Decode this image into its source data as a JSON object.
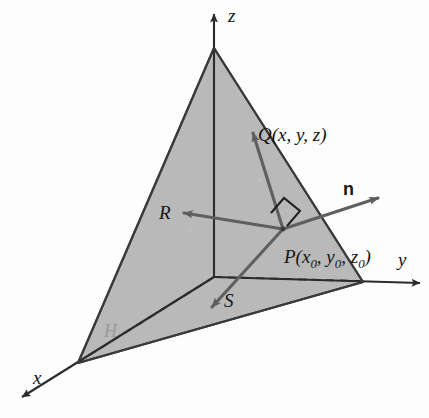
{
  "figure": {
    "background_color": "#fdfdfd",
    "plane_fill_color": "#b9b9b9",
    "plane_edge_color": "#3a3a3a",
    "axis_color": "#2b2b2b",
    "vector_color": "#5a5a5a",
    "dashed_color": "#333333",
    "faint_label_color": "#9a9a9a"
  },
  "axes": [
    {
      "id": "x",
      "label": "x",
      "label_x": 33,
      "label_y": 368,
      "direction": "down-left"
    },
    {
      "id": "y",
      "label": "y",
      "label_x": 398,
      "label_y": 250,
      "direction": "right"
    },
    {
      "id": "z",
      "label": "z",
      "label_x": 228,
      "label_y": 6,
      "direction": "up"
    }
  ],
  "points": [
    {
      "id": "P",
      "name": "P",
      "coords_text": "P(x0, y0, z0)",
      "base": "P(x",
      "sub1": "0",
      "mid1": ", y",
      "sub2": "0",
      "mid2": ", z",
      "sub3": "0",
      "tail": ")",
      "label_x": 284,
      "label_y": 247,
      "point_x": 283,
      "point_y": 229
    },
    {
      "id": "Q",
      "name": "Q",
      "coords_text": "Q(x, y, z)",
      "label_x": 258,
      "label_y": 125,
      "point_x": 252,
      "point_y": 131
    }
  ],
  "vectors": [
    {
      "id": "n",
      "label": "n",
      "label_x": 343,
      "label_y": 180,
      "from_x": 283,
      "from_y": 229,
      "to_x": 381,
      "to_y": 197,
      "bold": true
    },
    {
      "id": "PQ",
      "label": "",
      "label_x": 0,
      "label_y": 0,
      "from_x": 283,
      "from_y": 229,
      "to_x": 251,
      "to_y": 129,
      "bold": false
    },
    {
      "id": "R",
      "label": "R",
      "label_x": 159,
      "label_y": 203,
      "from_x": 283,
      "from_y": 229,
      "to_x": 181,
      "to_y": 212,
      "bold": false
    },
    {
      "id": "S",
      "label": "S",
      "label_x": 224,
      "label_y": 291,
      "from_x": 283,
      "from_y": 229,
      "to_x": 209,
      "to_y": 310,
      "bold": false
    }
  ],
  "annotations": [
    {
      "id": "H",
      "label": "H",
      "label_x": 104,
      "label_y": 322,
      "faint": true
    },
    {
      "id": "right-angle",
      "label": "",
      "x": 278,
      "y": 206,
      "size": 17
    }
  ],
  "plane": {
    "vertices": [
      {
        "x": 214,
        "y": 48
      },
      {
        "x": 363,
        "y": 282
      },
      {
        "x": 78,
        "y": 363
      }
    ],
    "label": "plane H"
  },
  "origin": {
    "x": 214,
    "y": 277
  },
  "dashed_segments": [
    {
      "id": "z-axis-hidden",
      "from_x": 214,
      "from_y": 52,
      "to_x": 214,
      "to_y": 277
    },
    {
      "id": "origin-to-y",
      "from_x": 214,
      "from_y": 277,
      "to_x": 360,
      "to_y": 281
    },
    {
      "id": "origin-to-x",
      "from_x": 214,
      "from_y": 277,
      "to_x": 80,
      "to_y": 361
    }
  ]
}
